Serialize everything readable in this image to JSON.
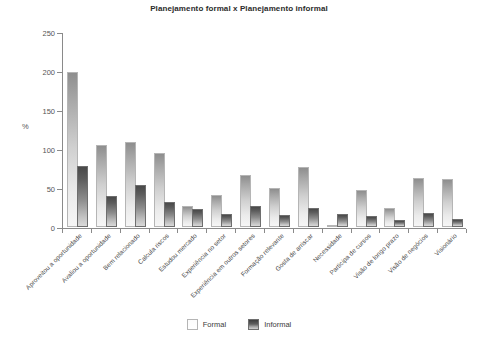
{
  "chart_data": {
    "type": "bar",
    "title": "Planejamento formal x Planejamento informal",
    "xlabel": "",
    "ylabel": "%",
    "ylim": [
      0,
      250
    ],
    "yticks": [
      0,
      50,
      100,
      150,
      200,
      250
    ],
    "grid": false,
    "legend_position": "bottom",
    "categories": [
      "Aproveitou a oportunidade",
      "Avaliou a oportunidade",
      "Bem relacionado",
      "Calcula riscos",
      "Estudou mercado",
      "Experiência no setor",
      "Experiência em outros setores",
      "Formação relevante",
      "Gosta de arriscar",
      "Necessidade",
      "Participa de cursos",
      "Visão de longo prazo",
      "Visão de negócios",
      "Visionário"
    ],
    "series": [
      {
        "name": "Formal",
        "color": "#ededed",
        "values": [
          196,
          103,
          106,
          92,
          24,
          39,
          64,
          48,
          75,
          0,
          45,
          22,
          60,
          59
        ]
      },
      {
        "name": "Informal",
        "color": "#555555",
        "values": [
          76,
          37,
          51,
          29,
          20,
          14,
          24,
          13,
          22,
          14,
          12,
          6,
          15,
          8
        ]
      }
    ]
  },
  "legend": {
    "items": [
      {
        "label": "Formal",
        "swatch": "formal"
      },
      {
        "label": "Informal",
        "swatch": "informal"
      }
    ]
  }
}
